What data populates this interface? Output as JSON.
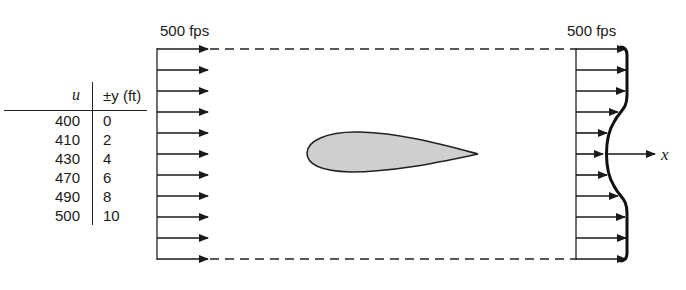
{
  "inlet": {
    "label": "500 fps",
    "arrow_count": 11
  },
  "outlet": {
    "label": "500 fps",
    "arrow_count": 11
  },
  "axis": {
    "label": "x"
  },
  "table": {
    "headers": {
      "u": "u",
      "y": "±y (ft)"
    },
    "rows": [
      {
        "u": "400",
        "y": "0"
      },
      {
        "u": "410",
        "y": "2"
      },
      {
        "u": "430",
        "y": "4"
      },
      {
        "u": "470",
        "y": "6"
      },
      {
        "u": "490",
        "y": "8"
      },
      {
        "u": "500",
        "y": "10"
      }
    ]
  },
  "airfoil": {
    "fill": "#cfcfcf",
    "stroke": "#222222"
  }
}
